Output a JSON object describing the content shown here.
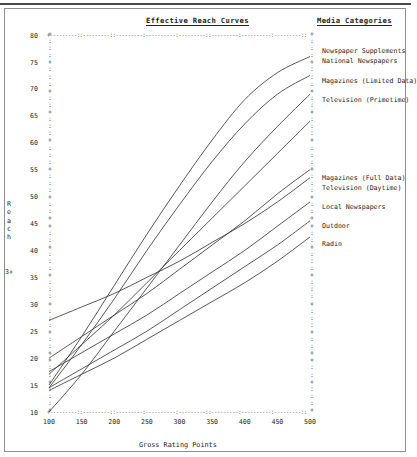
{
  "chart_title": "Effective Reach Curves",
  "legend_title": "Media Categories",
  "axes": {
    "x_title": "Gross Rating Points",
    "y_title_chars": [
      "R",
      "e",
      "a",
      "c",
      "h"
    ],
    "y_title_text": "Reach",
    "y_suffix": "3+",
    "x_ticks": [
      "100",
      "150",
      "200",
      "250",
      "300",
      "350",
      "400",
      "450",
      "500"
    ],
    "y_ticks": [
      "80",
      "75",
      "70",
      "65",
      "60",
      "55",
      "50",
      "45",
      "40",
      "35",
      "30",
      "25",
      "20",
      "15",
      "10"
    ]
  },
  "chart_data": {
    "type": "line",
    "title": "Effective Reach Curves",
    "xlabel": "Gross Rating Points",
    "ylabel": "Reach 3+",
    "xlim": [
      100,
      500
    ],
    "ylim": [
      10,
      80
    ],
    "grid": false,
    "legend_position": "right",
    "x": [
      100,
      150,
      200,
      250,
      300,
      350,
      400,
      450,
      500
    ],
    "series": [
      {
        "name": "Newspaper Supplements",
        "values": [
          15.0,
          24.0,
          33.5,
          43.0,
          52.0,
          60.5,
          68.0,
          73.0,
          76.0
        ]
      },
      {
        "name": "National Newspapers",
        "values": [
          14.5,
          22.5,
          31.0,
          40.0,
          48.5,
          56.5,
          63.5,
          69.0,
          72.5
        ]
      },
      {
        "name": "Magazines (Limited Data)",
        "values": [
          10.0,
          17.0,
          25.0,
          33.0,
          41.0,
          49.0,
          56.5,
          63.0,
          69.0
        ]
      },
      {
        "name": "Television (Primetime)",
        "values": [
          17.0,
          22.5,
          28.0,
          34.0,
          40.0,
          46.0,
          52.0,
          58.0,
          64.0
        ]
      },
      {
        "name": "Magazines (Full Data)",
        "values": [
          20.0,
          24.0,
          28.0,
          32.0,
          36.5,
          41.0,
          45.5,
          50.5,
          55.0
        ]
      },
      {
        "name": "Television (Daytime)",
        "values": [
          27.0,
          29.5,
          32.0,
          35.0,
          38.0,
          41.5,
          45.0,
          49.0,
          53.5
        ]
      },
      {
        "name": "Local Newspapers",
        "values": [
          17.5,
          21.0,
          24.5,
          28.0,
          32.0,
          36.0,
          40.0,
          44.5,
          49.0
        ]
      },
      {
        "name": "Outdoor",
        "values": [
          14.5,
          18.0,
          21.5,
          25.0,
          29.0,
          33.0,
          37.0,
          41.0,
          45.5
        ]
      },
      {
        "name": "Radio",
        "values": [
          14.0,
          17.0,
          20.0,
          23.5,
          27.0,
          30.5,
          34.0,
          38.0,
          42.5
        ]
      }
    ]
  },
  "legend_items": [
    {
      "label": "Newspaper Supplements",
      "top": 47
    },
    {
      "label": "National Newspapers",
      "top": 57
    },
    {
      "label": "Magazines (Limited Data)",
      "top": 77
    },
    {
      "label": "Television (Primetime)",
      "top": 96
    },
    {
      "label": "Magazines (Full Data)",
      "top": 174
    },
    {
      "label": "Television (Daytime)",
      "top": 184
    },
    {
      "label": "Local Newspapers",
      "top": 203
    },
    {
      "label": "Outdoor",
      "top": 222
    },
    {
      "label": "Radio",
      "top": 240
    }
  ]
}
